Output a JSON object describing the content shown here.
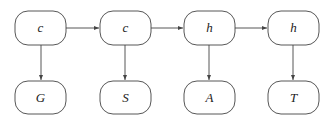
{
  "diagram": {
    "type": "flow",
    "colors": {
      "stroke": "#444444",
      "text": "#222222",
      "background": "#ffffff"
    },
    "nodes": [
      {
        "id": "n1",
        "label": "c",
        "row": "top",
        "col": 1
      },
      {
        "id": "n2",
        "label": "c",
        "row": "top",
        "col": 2
      },
      {
        "id": "n3",
        "label": "h",
        "row": "top",
        "col": 3
      },
      {
        "id": "n4",
        "label": "h",
        "row": "top",
        "col": 4
      },
      {
        "id": "n5",
        "label": "G",
        "row": "bottom",
        "col": 1
      },
      {
        "id": "n6",
        "label": "S",
        "row": "bottom",
        "col": 2
      },
      {
        "id": "n7",
        "label": "A",
        "row": "bottom",
        "col": 3
      },
      {
        "id": "n8",
        "label": "T",
        "row": "bottom",
        "col": 4
      }
    ],
    "edges": [
      {
        "from": "n1",
        "to": "n2"
      },
      {
        "from": "n2",
        "to": "n3"
      },
      {
        "from": "n3",
        "to": "n4"
      },
      {
        "from": "n1",
        "to": "n5"
      },
      {
        "from": "n2",
        "to": "n6"
      },
      {
        "from": "n3",
        "to": "n7"
      },
      {
        "from": "n4",
        "to": "n8"
      }
    ]
  }
}
